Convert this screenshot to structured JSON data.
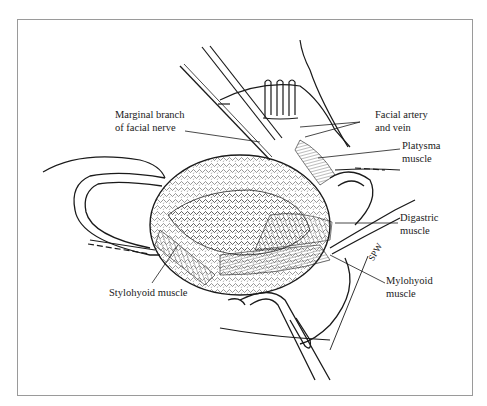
{
  "figure": {
    "type": "surgical anatomical illustration",
    "signature": "SPW",
    "labels": [
      {
        "id": "marginal-branch",
        "text": "Marginal branch\nof facial nerve"
      },
      {
        "id": "facial-artery-vein",
        "text": "Facial artery\nand vein"
      },
      {
        "id": "platysma",
        "text": "Platysma\nmuscle"
      },
      {
        "id": "digastric",
        "text": "Digastric\nmuscle"
      },
      {
        "id": "mylohyoid",
        "text": "Mylohyoid\nmuscle"
      },
      {
        "id": "stylohyoid",
        "text": "Stylohyoid muscle"
      }
    ]
  },
  "colors": {
    "ink": "#1a1a1a",
    "border": "#9a9a9a",
    "background": "#ffffff"
  }
}
